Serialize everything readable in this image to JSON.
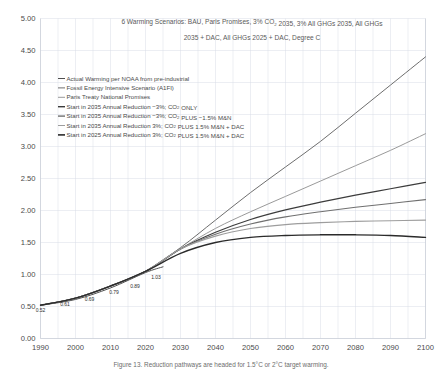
{
  "chart_data": {
    "type": "line",
    "title_line1": "6 Warming Scenarios: BAU, Paris Promises, 3% CO₂ 2035, 3% All GHGs 2035, All GHGs",
    "title_line2": "2035 + DAC, All GHGs 2025 + DAC, Degree C",
    "xlabel": "",
    "ylabel": "",
    "xlim": [
      1990,
      2100
    ],
    "ylim": [
      0.0,
      5.0
    ],
    "grid": true,
    "legend_position": "upper-left",
    "x_ticks": [
      "1990",
      "2000",
      "2010",
      "2020",
      "2030",
      "2040",
      "2050",
      "2060",
      "2070",
      "2080",
      "2090",
      "2100"
    ],
    "y_ticks": [
      "0.00",
      "0.50",
      "1.00",
      "1.50",
      "2.00",
      "2.50",
      "3.00",
      "3.50",
      "4.00",
      "4.50",
      "5.00"
    ],
    "x": [
      1990,
      2000,
      2010,
      2020,
      2030,
      2040,
      2050,
      2060,
      2070,
      2080,
      2090,
      2100
    ],
    "series": [
      {
        "name": "Actual Warming per NOAA from pre-industrial",
        "color": "#4f4f4f",
        "width": 1.0,
        "x": [
          1990,
          2000,
          2010,
          2020,
          2025
        ],
        "values": [
          0.52,
          0.61,
          0.79,
          1.03,
          1.12
        ]
      },
      {
        "name": "Fossil Energy Intensive Scenario (A1FI)",
        "color": "#6e6e6e",
        "width": 1.0,
        "values": [
          0.52,
          0.63,
          0.82,
          1.05,
          1.42,
          1.85,
          2.28,
          2.68,
          3.08,
          3.52,
          3.96,
          4.4
        ]
      },
      {
        "name": "Paris Treaty National Promises",
        "color": "#9a9a9a",
        "width": 1.0,
        "values": [
          0.52,
          0.63,
          0.82,
          1.05,
          1.4,
          1.72,
          1.98,
          2.22,
          2.46,
          2.7,
          2.94,
          3.2
        ]
      },
      {
        "name": "Start in 2035 Annual Reduction −3%; CO₂ ONLY",
        "color": "#3c3c3c",
        "width": 1.2,
        "values": [
          0.52,
          0.63,
          0.82,
          1.05,
          1.4,
          1.66,
          1.86,
          2.01,
          2.13,
          2.24,
          2.34,
          2.44
        ]
      },
      {
        "name": "Start in 2035 Annual Reduction −3%; CO₂ PLUS −1.5% M&N",
        "color": "#707070",
        "width": 1.1,
        "values": [
          0.52,
          0.63,
          0.82,
          1.05,
          1.4,
          1.63,
          1.79,
          1.9,
          1.98,
          2.05,
          2.11,
          2.17
        ]
      },
      {
        "name": "Start in 2035 Annual Reduction 3%; CO₂ PLUS 1.5% M&N + DAC",
        "color": "#9d9d9d",
        "width": 1.1,
        "values": [
          0.52,
          0.63,
          0.82,
          1.05,
          1.4,
          1.6,
          1.72,
          1.78,
          1.81,
          1.83,
          1.84,
          1.85
        ]
      },
      {
        "name": "Start in 2025 Annual Reduction 3%; CO₂ PLUS 1.5% M&N + DAC",
        "color": "#2b2b2b",
        "width": 1.4,
        "values": [
          0.52,
          0.63,
          0.82,
          1.05,
          1.33,
          1.5,
          1.58,
          1.61,
          1.62,
          1.62,
          1.61,
          1.58
        ]
      }
    ],
    "point_labels": [
      {
        "label": "0.52",
        "x": 1990,
        "y": 0.52
      },
      {
        "label": "0.61",
        "x": 1997,
        "y": 0.61
      },
      {
        "label": "0.69",
        "x": 2004,
        "y": 0.69
      },
      {
        "label": "0.79",
        "x": 2011,
        "y": 0.79
      },
      {
        "label": "0.89",
        "x": 2017,
        "y": 0.89
      },
      {
        "label": "1.03",
        "x": 2023,
        "y": 1.03
      }
    ]
  },
  "legend": {
    "items": [
      {
        "label": "Actual Warming per NOAA from pre-industrial",
        "color": "#4f4f4f",
        "width": 1.0
      },
      {
        "label": "Fossil Energy Intensive Scenario (A1FI)",
        "color": "#6e6e6e",
        "width": 1.0
      },
      {
        "label": "Paris Treaty National Promises",
        "color": "#9a9a9a",
        "width": 1.0
      },
      {
        "label": "Start in 2035 Annual Reduction −3%; CO₂ ONLY",
        "color": "#3c3c3c",
        "width": 1.4
      },
      {
        "label": "Start in 2035 Annual Reduction −3%; CO₂ PLUS −1.5% M&N",
        "color": "#707070",
        "width": 1.4
      },
      {
        "label": "Start in 2035 Annual Reduction 3%; CO₂ PLUS 1.5% M&N + DAC",
        "color": "#9d9d9d",
        "width": 1.0
      },
      {
        "label": "Start in 2025 Annual Reduction 3%; CO₂ PLUS 1.5% M&N + DAC",
        "color": "#2b2b2b",
        "width": 1.6
      }
    ]
  },
  "caption": {
    "text": "Figure 13. Reduction pathways are headed for 1.5°C or 2°C target warming."
  }
}
